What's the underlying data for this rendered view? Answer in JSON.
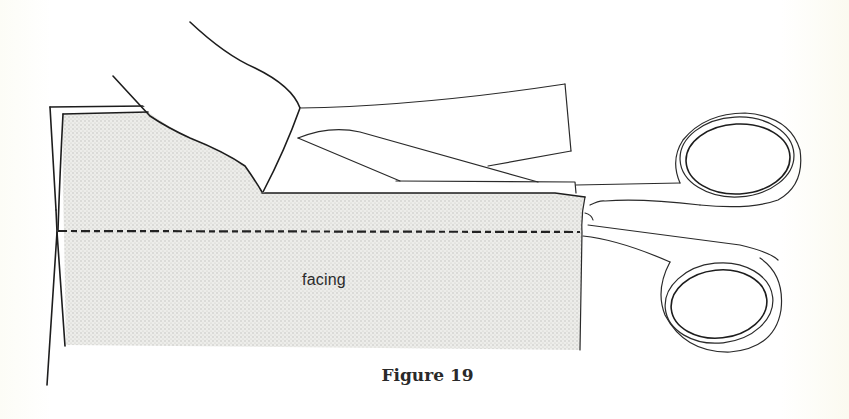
{
  "figure": {
    "caption": "Figure 19",
    "label_facing": "facing"
  },
  "elements": {
    "fabric": {
      "name": "facing",
      "fill": "stippled light gray",
      "stitch_line": "dashed"
    },
    "scissors": {
      "handles": 2,
      "blades": "closed along fabric edge"
    },
    "hand": "left hand holding fabric flap"
  },
  "colors": {
    "ink": "#1d1d1d",
    "fabric_tint": "#e6e6e3",
    "paper": "#fefefc"
  }
}
